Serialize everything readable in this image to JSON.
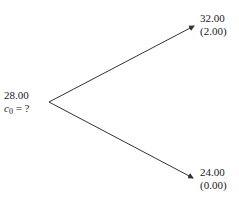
{
  "root": {
    "price": "28.00",
    "option_label_var": "c",
    "option_label_sub": "0",
    "option_label_rest": " = ?"
  },
  "up": {
    "price": "32.00",
    "payoff": "(2.00)"
  },
  "down": {
    "price": "24.00",
    "payoff": "(0.00)"
  },
  "colors": {
    "line": "#333333",
    "text": "#1a1a1a"
  }
}
